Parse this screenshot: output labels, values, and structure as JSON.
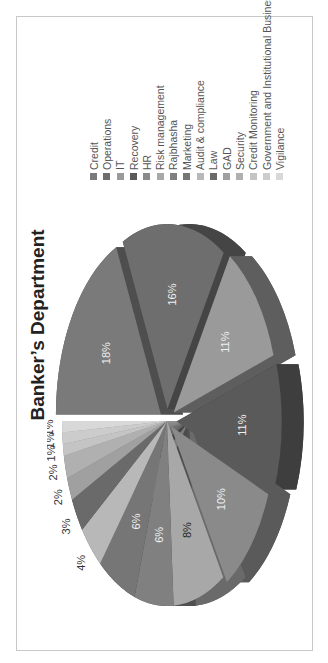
{
  "slide": {
    "title": "Banker’s Department",
    "orientation": "rotated-90-ccw"
  },
  "chart_data": {
    "type": "pie",
    "style": "3d-exploded",
    "title": "Banker’s Department",
    "categories": [
      "Credit",
      "Operations",
      "IT",
      "Recovery",
      "HR",
      "Risk management",
      "Rajbhasha",
      "Marketing",
      "Audit & compliance",
      "Law",
      "GAD",
      "Security",
      "Credit Monitoring",
      "Government and Institutional Business",
      "Vigilance"
    ],
    "values": [
      18,
      16,
      11,
      11,
      10,
      8,
      6,
      6,
      4,
      3,
      2,
      2,
      1,
      1,
      1
    ],
    "labels": [
      "18%",
      "16%",
      "11%",
      "11%",
      "10%",
      "8%",
      "6%",
      "6%",
      "4%",
      "3%",
      "2%",
      "2%",
      "1%",
      "1%",
      "1%"
    ],
    "unit": "%",
    "legend_position": "right",
    "colors": [
      "#7a7a7a",
      "#6e6e6e",
      "#9a9a9a",
      "#5a5a5a",
      "#8a8a8a",
      "#a8a8a8",
      "#808080",
      "#767676",
      "#b8b8b8",
      "#6a6a6a",
      "#a0a0a0",
      "#b0b0b0",
      "#c4c4c4",
      "#cccccc",
      "#d8d8d8"
    ],
    "side_colors": [
      "#4e4e4e",
      "#454545",
      "#5e5e5e",
      "#3e3e3e",
      "#5a5a5a",
      "#6a6a6a",
      "#505050",
      "#4a4a4a",
      "#7a7a7a",
      "#444444",
      "#666666",
      "#707070",
      "#808080",
      "#888888",
      "#909090"
    ]
  },
  "legend": {
    "items": [
      {
        "label": "Credit",
        "color": "#7a7a7a"
      },
      {
        "label": "Operations",
        "color": "#6e6e6e"
      },
      {
        "label": "IT",
        "color": "#9a9a9a"
      },
      {
        "label": "Recovery",
        "color": "#5a5a5a"
      },
      {
        "label": "HR",
        "color": "#8a8a8a"
      },
      {
        "label": "Risk management",
        "color": "#a8a8a8"
      },
      {
        "label": "Rajbhasha",
        "color": "#808080"
      },
      {
        "label": "Marketing",
        "color": "#767676"
      },
      {
        "label": "Audit & compliance",
        "color": "#b8b8b8"
      },
      {
        "label": "Law",
        "color": "#6a6a6a"
      },
      {
        "label": "GAD",
        "color": "#a0a0a0"
      },
      {
        "label": "Security",
        "color": "#b0b0b0"
      },
      {
        "label": "Credit Monitoring",
        "color": "#c4c4c4"
      },
      {
        "label": "Government and Institutional Business",
        "color": "#cccccc"
      },
      {
        "label": "Vigilance",
        "color": "#d8d8d8"
      }
    ]
  }
}
